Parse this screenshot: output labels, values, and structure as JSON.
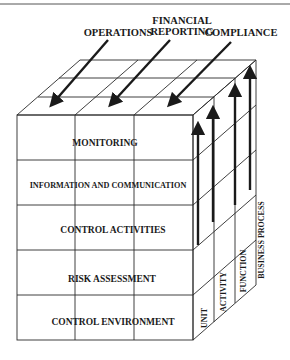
{
  "diagram": {
    "objectives": [
      {
        "label_line1": "OPERATIONS",
        "label_line2": ""
      },
      {
        "label_line1": "FINANCIAL",
        "label_line2": "REPORTING"
      },
      {
        "label_line1": "COMPLIANCE",
        "label_line2": ""
      }
    ],
    "components": [
      "MONITORING",
      "INFORMATION  AND COMMUNICATION",
      "CONTROL ACTIVITIES",
      "RISK ASSESSMENT",
      "CONTROL ENVIRONMENT"
    ],
    "units": [
      "UNIT",
      "ACTIVITY",
      "FUNCTION",
      "BUSINESS PROCESS"
    ],
    "colors": {
      "line": "#2a2a2a",
      "text": "#1a1a1a",
      "background": "#ffffff"
    }
  }
}
